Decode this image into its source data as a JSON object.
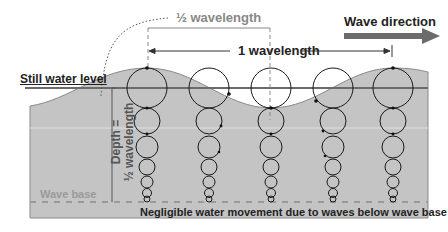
{
  "labels": {
    "half_wavelength": "½ wavelength",
    "one_wavelength": "1 wavelength",
    "wave_direction": "Wave direction",
    "still_water_level": "Still water level",
    "depth_line1": "Depth =",
    "depth_line2": "½ wavelength",
    "wave_base": "Wave base",
    "negligible_note": "Negligible water movement due to waves below wave base"
  },
  "colors": {
    "water": "#c4c4c4",
    "water_edge": "#8a8a8a",
    "still_water_line": "#6b6b6b",
    "arrow": "#6b6b6b",
    "wave_base_dash": "#9a9a9a",
    "wave_base_label": "#9a9a9a",
    "circles": "#1a1a1a",
    "text": "#222222"
  },
  "orbit_columns": [
    {
      "x": 147,
      "phase": "crest"
    },
    {
      "x": 209,
      "phase": "falling"
    },
    {
      "x": 271,
      "phase": "trough"
    },
    {
      "x": 333,
      "phase": "rising"
    },
    {
      "x": 393,
      "phase": "crest"
    }
  ]
}
